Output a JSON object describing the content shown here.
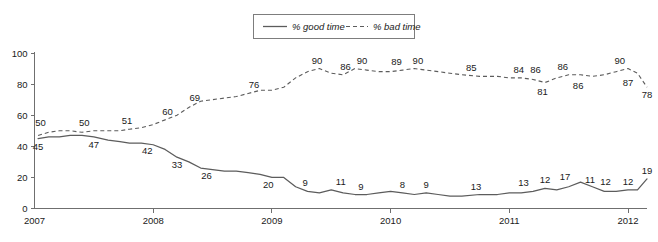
{
  "chart_data": {
    "type": "line",
    "title": "",
    "subtitle": "",
    "xlabel": "",
    "ylabel": "",
    "xlim": [
      2007.0,
      2012.16
    ],
    "ylim": [
      0,
      100
    ],
    "grid": false,
    "legend_position": "top-center",
    "x_tick_labels": [
      "2007",
      "2008",
      "2009",
      "2010",
      "2011",
      "2012"
    ],
    "x_tick_values": [
      2007,
      2008,
      2009,
      2010,
      2011,
      2012
    ],
    "y_tick_labels": [
      "0",
      "20",
      "40",
      "60",
      "80",
      "100"
    ],
    "y_tick_values": [
      0,
      20,
      40,
      60,
      80,
      100
    ],
    "series": [
      {
        "name": "% good time",
        "style": "solid",
        "color": "#5c5c5c",
        "x": [
          2007.03,
          2007.12,
          2007.21,
          2007.3,
          2007.4,
          2007.5,
          2007.62,
          2007.72,
          2007.8,
          2007.9,
          2008.0,
          2008.1,
          2008.2,
          2008.3,
          2008.4,
          2008.5,
          2008.6,
          2008.7,
          2008.8,
          2008.9,
          2009.0,
          2009.1,
          2009.2,
          2009.3,
          2009.4,
          2009.5,
          2009.6,
          2009.7,
          2009.8,
          2009.9,
          2010.0,
          2010.1,
          2010.2,
          2010.3,
          2010.4,
          2010.5,
          2010.6,
          2010.75,
          2010.9,
          2011.0,
          2011.1,
          2011.2,
          2011.3,
          2011.4,
          2011.5,
          2011.6,
          2011.7,
          2011.8,
          2011.9,
          2012.0,
          2012.08,
          2012.16
        ],
        "y": [
          45,
          46,
          46,
          47,
          47,
          46,
          44,
          43,
          42,
          42,
          41,
          38,
          33,
          30,
          26,
          25,
          24,
          24,
          23,
          22,
          20,
          20,
          14,
          11,
          10,
          12,
          10,
          9,
          9,
          10,
          11,
          10,
          9,
          10,
          9,
          8,
          8,
          9,
          9,
          10,
          10,
          11,
          13,
          12,
          14,
          17,
          14,
          11,
          11,
          12,
          12,
          19
        ],
        "labeled_points": [
          {
            "x": 2007.03,
            "y": 45,
            "label": "45",
            "pos": "below"
          },
          {
            "x": 2007.5,
            "y": 46,
            "label": "47",
            "pos": "below"
          },
          {
            "x": 2007.95,
            "y": 42,
            "label": "42",
            "pos": "below"
          },
          {
            "x": 2008.2,
            "y": 33,
            "label": "33",
            "pos": "below"
          },
          {
            "x": 2008.45,
            "y": 26,
            "label": "26",
            "pos": "below"
          },
          {
            "x": 2008.97,
            "y": 20,
            "label": "20",
            "pos": "below"
          },
          {
            "x": 2009.28,
            "y": 11,
            "label": "9",
            "pos": "above"
          },
          {
            "x": 2009.58,
            "y": 12,
            "label": "11",
            "pos": "above"
          },
          {
            "x": 2009.75,
            "y": 9,
            "label": "9",
            "pos": "above"
          },
          {
            "x": 2010.1,
            "y": 10,
            "label": "8",
            "pos": "above"
          },
          {
            "x": 2010.3,
            "y": 10,
            "label": "9",
            "pos": "above"
          },
          {
            "x": 2010.72,
            "y": 9,
            "label": "13",
            "pos": "above"
          },
          {
            "x": 2011.12,
            "y": 11,
            "label": "13",
            "pos": "above"
          },
          {
            "x": 2011.3,
            "y": 13,
            "label": "12",
            "pos": "above"
          },
          {
            "x": 2011.47,
            "y": 15,
            "label": "17",
            "pos": "above"
          },
          {
            "x": 2011.68,
            "y": 13,
            "label": "11",
            "pos": "above"
          },
          {
            "x": 2011.81,
            "y": 12,
            "label": "12",
            "pos": "above"
          },
          {
            "x": 2012.0,
            "y": 12,
            "label": "12",
            "pos": "above"
          },
          {
            "x": 2012.16,
            "y": 19,
            "label": "19",
            "pos": "above"
          }
        ]
      },
      {
        "name": "% bad time",
        "style": "dashed",
        "color": "#5c5c5c",
        "x": [
          2007.03,
          2007.12,
          2007.21,
          2007.3,
          2007.4,
          2007.5,
          2007.62,
          2007.72,
          2007.8,
          2007.9,
          2008.0,
          2008.1,
          2008.2,
          2008.3,
          2008.4,
          2008.5,
          2008.6,
          2008.7,
          2008.8,
          2008.9,
          2009.0,
          2009.1,
          2009.2,
          2009.3,
          2009.4,
          2009.5,
          2009.6,
          2009.7,
          2009.8,
          2009.9,
          2010.0,
          2010.1,
          2010.2,
          2010.3,
          2010.4,
          2010.5,
          2010.6,
          2010.75,
          2010.9,
          2011.0,
          2011.1,
          2011.2,
          2011.3,
          2011.4,
          2011.5,
          2011.6,
          2011.7,
          2011.8,
          2011.9,
          2012.0,
          2012.08,
          2012.16
        ],
        "y": [
          47,
          49,
          50,
          50,
          49,
          50,
          50,
          50,
          51,
          52,
          54,
          57,
          60,
          65,
          69,
          70,
          71,
          72,
          74,
          76,
          76,
          78,
          84,
          88,
          90,
          87,
          86,
          90,
          89,
          88,
          88,
          89,
          90,
          89,
          88,
          87,
          86,
          85,
          85,
          84,
          84,
          83,
          81,
          84,
          86,
          86,
          85,
          86,
          88,
          90,
          87,
          78
        ],
        "labeled_points": [
          {
            "x": 2007.05,
            "y": 50,
            "label": "50",
            "pos": "above"
          },
          {
            "x": 2007.42,
            "y": 50,
            "label": "50",
            "pos": "above"
          },
          {
            "x": 2007.78,
            "y": 51,
            "label": "51",
            "pos": "above"
          },
          {
            "x": 2008.12,
            "y": 57,
            "label": "60",
            "pos": "above"
          },
          {
            "x": 2008.35,
            "y": 66,
            "label": "69",
            "pos": "above"
          },
          {
            "x": 2008.85,
            "y": 74,
            "label": "76",
            "pos": "above"
          },
          {
            "x": 2009.38,
            "y": 90,
            "label": "90",
            "pos": "above"
          },
          {
            "x": 2009.62,
            "y": 86,
            "label": "86",
            "pos": "above"
          },
          {
            "x": 2009.76,
            "y": 90,
            "label": "90",
            "pos": "above"
          },
          {
            "x": 2010.05,
            "y": 89,
            "label": "89",
            "pos": "above"
          },
          {
            "x": 2010.23,
            "y": 90,
            "label": "90",
            "pos": "above"
          },
          {
            "x": 2010.68,
            "y": 85,
            "label": "85",
            "pos": "above"
          },
          {
            "x": 2011.08,
            "y": 84,
            "label": "84",
            "pos": "above"
          },
          {
            "x": 2011.22,
            "y": 84,
            "label": "86",
            "pos": "above"
          },
          {
            "x": 2011.28,
            "y": 80,
            "label": "81",
            "pos": "below"
          },
          {
            "x": 2011.45,
            "y": 86,
            "label": "86",
            "pos": "above"
          },
          {
            "x": 2011.58,
            "y": 84,
            "label": "86",
            "pos": "below"
          },
          {
            "x": 2011.93,
            "y": 90,
            "label": "90",
            "pos": "above"
          },
          {
            "x": 2012.0,
            "y": 86,
            "label": "87",
            "pos": "below"
          },
          {
            "x": 2012.16,
            "y": 78,
            "label": "78",
            "pos": "below"
          }
        ]
      }
    ],
    "legend": [
      {
        "label": "% good time",
        "style": "solid"
      },
      {
        "label": "% bad time",
        "style": "dashed"
      }
    ]
  }
}
